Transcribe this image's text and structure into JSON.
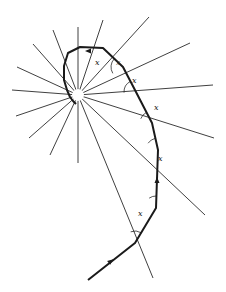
{
  "diagram": {
    "center": [
      78,
      95
    ],
    "angle_label": "x",
    "colors": {
      "line": "#2a2a2a",
      "path": "#1a1a1a",
      "background": "#ffffff"
    },
    "rays": [
      [
        78,
        27
      ],
      [
        103,
        20
      ],
      [
        149,
        17
      ],
      [
        190,
        43
      ],
      [
        213,
        85
      ],
      [
        214,
        138
      ],
      [
        205,
        215
      ],
      [
        153,
        278
      ],
      [
        78,
        163
      ],
      [
        50,
        155
      ],
      [
        29,
        138
      ],
      [
        16,
        116
      ],
      [
        12,
        90
      ],
      [
        17,
        67
      ],
      [
        33,
        44
      ],
      [
        53,
        30
      ]
    ],
    "path_points": [
      [
        88,
        280
      ],
      [
        135,
        243
      ],
      [
        156,
        208
      ],
      [
        158,
        150
      ],
      [
        152,
        123
      ],
      [
        136,
        92
      ],
      [
        123,
        67
      ],
      [
        103,
        48
      ],
      [
        80,
        47
      ],
      [
        68,
        53
      ],
      [
        64,
        66
      ],
      [
        64,
        80
      ],
      [
        67,
        90
      ],
      [
        70,
        97
      ],
      [
        73,
        101
      ],
      [
        76,
        104
      ]
    ],
    "angle_markers": [
      {
        "vertex": [
          135,
          243
        ],
        "label": "x",
        "label_pos": [
          138,
          216
        ]
      },
      {
        "vertex": [
          156,
          208
        ],
        "label": "x",
        "label_pos": [
          158,
          161
        ]
      },
      {
        "vertex": [
          158,
          150
        ],
        "label": "x",
        "label_pos": [
          154,
          110
        ]
      },
      {
        "vertex": [
          152,
          123
        ],
        "label": "x",
        "label_pos": [
          132,
          83
        ]
      },
      {
        "vertex": [
          136,
          92
        ],
        "label": "x",
        "label_pos": [
          116,
          65
        ]
      },
      {
        "vertex": [
          123,
          67
        ],
        "label": "x",
        "label_pos": [
          95,
          65
        ]
      }
    ],
    "arrows": [
      {
        "at": [
          111,
          261
        ],
        "direction": "up-right"
      },
      {
        "at": [
          157,
          180
        ],
        "direction": "up"
      },
      {
        "at": [
          88,
          51
        ],
        "direction": "left"
      }
    ]
  }
}
